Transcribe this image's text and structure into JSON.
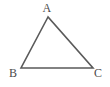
{
  "figure": {
    "name": "triangle-abc",
    "type": "geometry-diagram",
    "background_color": "#ffffff",
    "stroke_color": "#5a5a5a",
    "label_color": "#4b4b4b",
    "stroke_width": 1.6,
    "canvas": {
      "width": 110,
      "height": 87
    }
  },
  "vertices": [
    {
      "id": "A",
      "label": "A",
      "x": 48,
      "y": 17,
      "label_x": 47,
      "label_y": 8
    },
    {
      "id": "B",
      "label": "B",
      "x": 21,
      "y": 68,
      "label_x": 13,
      "label_y": 73
    },
    {
      "id": "C",
      "label": "C",
      "x": 93,
      "y": 68,
      "label_x": 98,
      "label_y": 73
    }
  ],
  "edges": [
    {
      "id": "AB",
      "from": "A",
      "to": "B"
    },
    {
      "id": "BC",
      "from": "B",
      "to": "C"
    },
    {
      "id": "CA",
      "from": "C",
      "to": "A"
    }
  ],
  "path": "M 48 17 L 21 68 L 93 68 Z"
}
